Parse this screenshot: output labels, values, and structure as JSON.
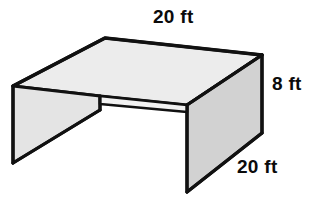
{
  "figure": {
    "name": "open-box-prism",
    "colors": {
      "outline": "#111111",
      "top_face_fill": "#ececec",
      "left_face_fill": "#e4e4e4",
      "right_face_fill": "#d2d2d2",
      "front_edge_fill": "#f2f2f2",
      "background": "#ffffff",
      "label_text": "#0b0b0b"
    },
    "labels": {
      "top": "20 ft",
      "right": "8 ft",
      "bottom": "20 ft"
    },
    "measurements": [
      {
        "id": "top-length",
        "value": 20,
        "unit": "ft",
        "text": "20 ft",
        "edge": "top-back-width"
      },
      {
        "id": "right-height",
        "value": 8,
        "unit": "ft",
        "text": "8 ft",
        "edge": "right-vertical-height"
      },
      {
        "id": "bottom-depth",
        "value": 20,
        "unit": "ft",
        "text": "20 ft",
        "edge": "right-bottom-depth"
      }
    ]
  }
}
